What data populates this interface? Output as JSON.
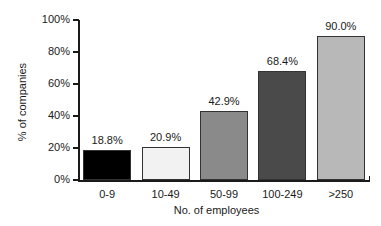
{
  "chart_data": {
    "type": "bar",
    "title": "",
    "subtitle": "",
    "xlabel": "No. of employees",
    "ylabel": "% of companies",
    "categories": [
      "0-9",
      "10-49",
      "50-99",
      "100-249",
      ">250"
    ],
    "values": [
      18.8,
      20.9,
      42.9,
      68.4,
      90.0
    ],
    "data_labels": [
      "18.8%",
      "20.9%",
      "42.9%",
      "68.4%",
      "90.0%"
    ],
    "ylim": [
      0,
      100
    ],
    "ytick_values": [
      0,
      20,
      40,
      60,
      80,
      100
    ],
    "ytick_labels": [
      "0%",
      "20%",
      "40%",
      "60%",
      "80%",
      "100%"
    ],
    "grid": false,
    "legend": null,
    "legend_position": "none",
    "bar_colors": [
      "#000000",
      "#f2f2f2",
      "#8a8a8a",
      "#4a4a4a",
      "#b8b8b8"
    ],
    "bar_border_color": "#333333",
    "axis_color": "#1a1a1a",
    "background_color": "#ffffff",
    "series": [
      {
        "name": "% of companies",
        "values": [
          18.8,
          20.9,
          42.9,
          68.4,
          90.0
        ]
      }
    ]
  }
}
